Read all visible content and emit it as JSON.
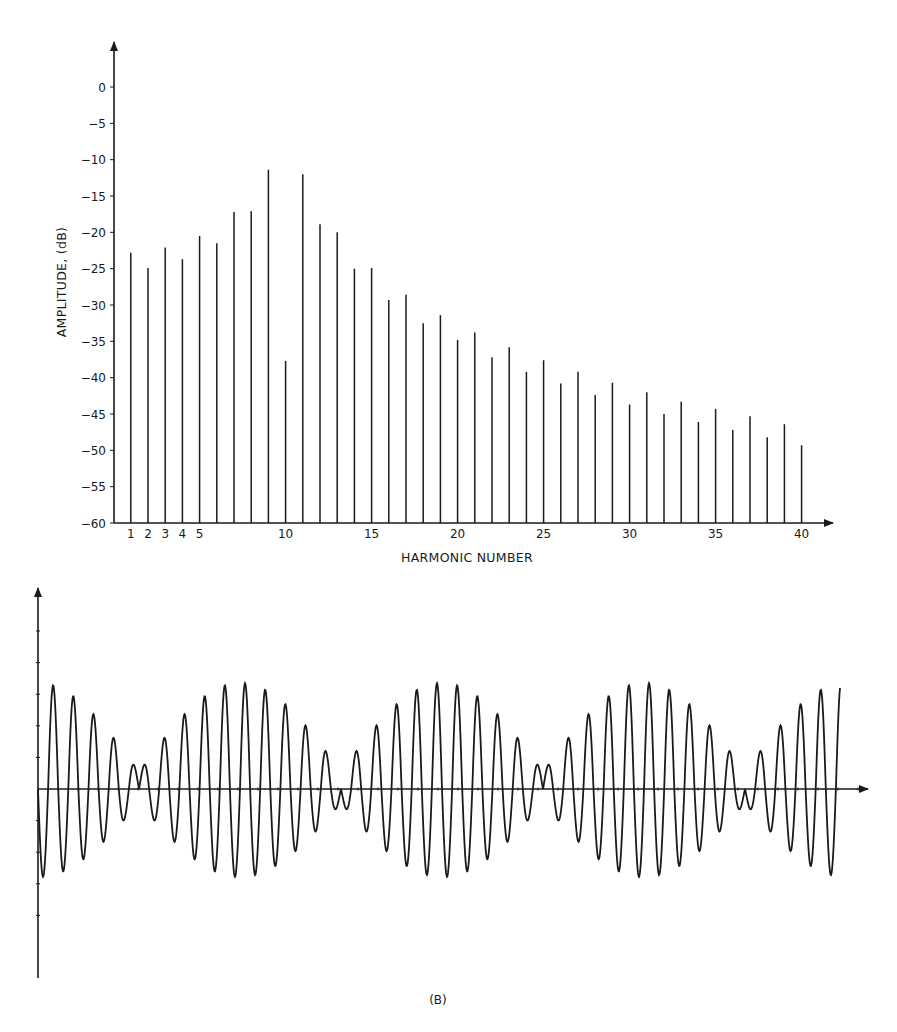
{
  "chart_data": [
    {
      "type": "bar",
      "subtype": "line-spectrum",
      "title": "",
      "xlabel": "HARMONIC NUMBER",
      "ylabel": "AMPLITUDE, (dB)",
      "ylim": [
        -60,
        0
      ],
      "xlim": [
        0,
        41
      ],
      "grid": false,
      "legend": null,
      "y_ticks": [
        0,
        -5,
        -10,
        -15,
        -20,
        -25,
        -30,
        -35,
        -40,
        -45,
        -50,
        -55,
        -60
      ],
      "y_tick_labels": [
        "0",
        "-5",
        "-10",
        "-15",
        "-20",
        "-25",
        "-30",
        "-35",
        "-40",
        "-45",
        "-50",
        "-55",
        "-60"
      ],
      "x_ticks": [
        1,
        2,
        3,
        4,
        5,
        10,
        15,
        20,
        25,
        30,
        35,
        40
      ],
      "x_tick_labels": [
        "1",
        "2",
        "3",
        "4",
        "5",
        "10",
        "15",
        "20",
        "25",
        "30",
        "35",
        "40"
      ],
      "categories": [
        1,
        2,
        3,
        4,
        5,
        6,
        7,
        8,
        9,
        10,
        11,
        12,
        13,
        14,
        15,
        16,
        17,
        18,
        19,
        20,
        21,
        22,
        23,
        24,
        25,
        26,
        27,
        28,
        29,
        30,
        31,
        32,
        33,
        34,
        35,
        36,
        37,
        38,
        39,
        40
      ],
      "values": [
        -22.8,
        -24.9,
        -22.1,
        -23.7,
        -20.5,
        -21.5,
        -17.2,
        -17.1,
        -11.4,
        -37.7,
        -12.0,
        -18.9,
        -20.0,
        -25.0,
        -24.9,
        -29.3,
        -28.6,
        -32.5,
        -31.4,
        -34.8,
        -33.8,
        -37.2,
        -35.8,
        -39.2,
        -37.6,
        -40.8,
        -39.2,
        -42.4,
        -40.7,
        -43.7,
        -42.0,
        -45.0,
        -43.3,
        -46.1,
        -44.3,
        -47.2,
        -45.3,
        -48.2,
        -46.4,
        -49.3
      ]
    },
    {
      "type": "line",
      "subtype": "time-waveform",
      "title": "",
      "xlabel": "",
      "ylabel": "",
      "panel_label": "(B)",
      "grid": false,
      "legend": null,
      "description": "Periodic waveform: carrier of ~10 cycles per period amplitude-modulated by an envelope; double peak with zero crossing at envelope maxima, small notch at envelope minima",
      "periods_shown": 4,
      "cycles_per_period": 10,
      "relative_peak_positive": 1.0,
      "relative_peak_negative": -0.83,
      "envelope_max_centers_fraction": [
        0.25,
        0.5,
        0.75
      ],
      "envelope_min_centers_fraction": [
        0.125,
        0.375,
        0.625,
        0.875
      ]
    }
  ],
  "spectrum": {
    "ylabel": "AMPLITUDE, (dB)",
    "xlabel": "HARMONIC NUMBER"
  },
  "waveform": {
    "panel_label": "(B)"
  },
  "colors": {
    "ink": "#1a1a1a",
    "background": "#ffffff"
  }
}
